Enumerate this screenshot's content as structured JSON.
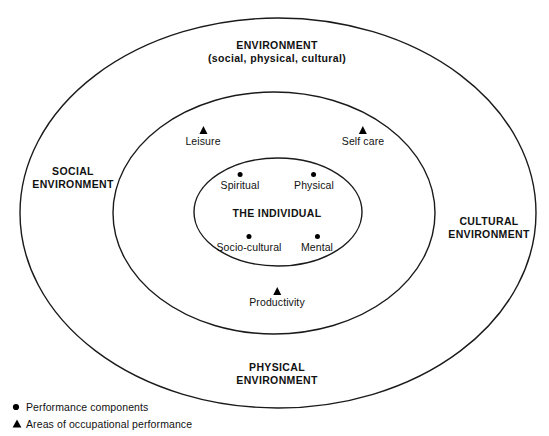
{
  "diagram": {
    "stroke_color": "#1a1a1a",
    "background_color": "#ffffff",
    "rings": [
      {
        "id": "outer",
        "name": "environment-ring",
        "labels": [
          {
            "name": "environment-title",
            "line1": "ENVIRONMENT",
            "line2": "(social, physical, cultural)"
          },
          {
            "name": "social-environment",
            "line1": "SOCIAL",
            "line2": "ENVIRONMENT"
          },
          {
            "name": "cultural-environment",
            "line1": "CULTURAL",
            "line2": "ENVIRONMENT"
          },
          {
            "name": "physical-environment",
            "line1": "PHYSICAL",
            "line2": "ENVIRONMENT"
          }
        ]
      },
      {
        "id": "middle",
        "name": "occupational-performance-ring",
        "markers": [
          {
            "name": "leisure",
            "label": "Leisure",
            "glyph": "triangle-icon"
          },
          {
            "name": "self-care",
            "label": "Self care",
            "glyph": "triangle-icon"
          },
          {
            "name": "productivity",
            "label": "Productivity",
            "glyph": "triangle-icon"
          }
        ]
      },
      {
        "id": "inner",
        "name": "the-individual-ring",
        "center_label": "THE INDIVIDUAL",
        "markers": [
          {
            "name": "spiritual",
            "label": "Spiritual",
            "glyph": "dot-icon"
          },
          {
            "name": "physical-component",
            "label": "Physical",
            "glyph": "dot-icon"
          },
          {
            "name": "socio-cultural",
            "label": "Socio-cultural",
            "glyph": "dot-icon"
          },
          {
            "name": "mental",
            "label": "Mental",
            "glyph": "dot-icon"
          }
        ]
      }
    ]
  },
  "legend": {
    "items": [
      {
        "glyph": "dot-icon",
        "text": "Performance components"
      },
      {
        "glyph": "triangle-icon",
        "text": "Areas of occupational performance"
      }
    ]
  }
}
